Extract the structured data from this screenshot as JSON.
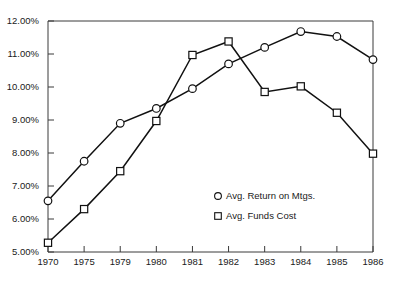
{
  "chart_data": {
    "type": "line",
    "title": "",
    "subtitle": "",
    "xlabel": "",
    "ylabel": "",
    "categories": [
      "1970",
      "1975",
      "1979",
      "1980",
      "1981",
      "1982",
      "1983",
      "1984",
      "1985",
      "1986"
    ],
    "ylim": [
      5.0,
      12.0
    ],
    "ytick_values": [
      5.0,
      6.0,
      7.0,
      8.0,
      9.0,
      10.0,
      11.0,
      12.0
    ],
    "ytick_labels": [
      "5.00%",
      "6.00%",
      "7.00%",
      "8.00%",
      "9.00%",
      "10.00%",
      "11.00%",
      "12.00%"
    ],
    "grid": false,
    "legend_position": "inside-lower-right",
    "series": [
      {
        "name": "Avg. Return on Mtgs.",
        "marker": "circle",
        "values": [
          6.55,
          7.75,
          8.9,
          9.35,
          9.95,
          10.7,
          11.2,
          11.68,
          11.53,
          10.83
        ]
      },
      {
        "name": "Avg. Funds Cost",
        "marker": "square",
        "values": [
          5.28,
          6.3,
          7.45,
          8.97,
          10.97,
          11.38,
          9.85,
          10.02,
          9.22,
          7.98
        ]
      }
    ],
    "colors": {
      "line": "#111111",
      "marker_fill": "#ffffff",
      "axis": "#3a3a3a",
      "text": "#1a1a1a",
      "background": "#ffffff"
    }
  },
  "legend": {
    "items": [
      {
        "label": "Avg. Return on Mtgs.",
        "marker": "circle-marker-icon"
      },
      {
        "label": "Avg. Funds Cost",
        "marker": "square-marker-icon"
      }
    ]
  }
}
